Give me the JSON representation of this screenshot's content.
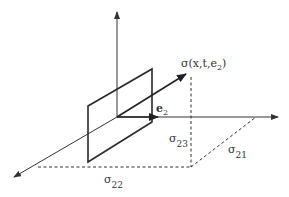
{
  "diagram": {
    "labels": {
      "stress_vector": "σ(x,t,e",
      "stress_vector_sub": "2",
      "stress_vector_close": ")",
      "normal": "e",
      "normal_sub": "2",
      "sigma23": "σ",
      "sigma23_sub": "23",
      "sigma21": "σ",
      "sigma21_sub": "21",
      "sigma22": "σ",
      "sigma22_sub": "22"
    },
    "colors": {
      "line": "#333333",
      "plane": "#2a2a2a",
      "dashed": "#333333"
    }
  }
}
